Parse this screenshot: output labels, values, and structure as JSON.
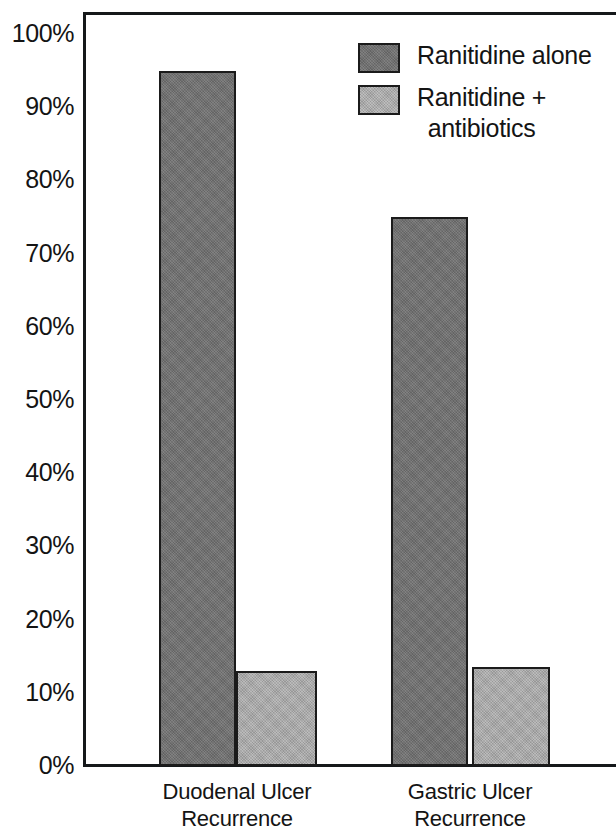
{
  "chart_data": {
    "type": "bar",
    "title": "",
    "xlabel": "",
    "ylabel": "",
    "categories": [
      "Duodenal Ulcer Recurrence",
      "Gastric Ulcer Recurrence"
    ],
    "category_lines": [
      [
        "Duodenal Ulcer",
        "Recurrence"
      ],
      [
        "Gastric Ulcer",
        "Recurrence"
      ]
    ],
    "series": [
      {
        "name": "Ranitidine alone",
        "values": [
          95,
          75
        ],
        "color": "#707070"
      },
      {
        "name": "Ranitidine + antibiotics",
        "values": [
          13,
          13.5
        ],
        "color": "#a9a9a9"
      }
    ],
    "ylim": [
      0,
      100
    ],
    "ytick_labels": [
      "100%",
      "90%",
      "80%",
      "70%",
      "60%",
      "50%",
      "40%",
      "30%",
      "20%",
      "10%",
      "0%"
    ],
    "ytick_values": [
      100,
      90,
      80,
      70,
      60,
      50,
      40,
      30,
      20,
      10,
      0
    ],
    "grid": false,
    "legend_position": "top-right",
    "axis_color": "#15181a",
    "bar_border_color": "#1b1b1b"
  },
  "legend": {
    "entries": [
      {
        "label": "Ranitidine alone",
        "line1": "Ranitidine alone",
        "line2": "",
        "swatch": "dark"
      },
      {
        "label": "Ranitidine + antibiotics",
        "line1": "Ranitidine +",
        "line2": "antibiotics",
        "swatch": "light"
      }
    ]
  },
  "axis": {
    "y_ticks": [
      {
        "label": "100%",
        "value": 100
      },
      {
        "label": "90%",
        "value": 90
      },
      {
        "label": "80%",
        "value": 80
      },
      {
        "label": "70%",
        "value": 70
      },
      {
        "label": "60%",
        "value": 60
      },
      {
        "label": "50%",
        "value": 50
      },
      {
        "label": "40%",
        "value": 40
      },
      {
        "label": "30%",
        "value": 30
      },
      {
        "label": "20%",
        "value": 20
      },
      {
        "label": "10%",
        "value": 10
      },
      {
        "label": "0%",
        "value": 0
      }
    ]
  },
  "x_categories": [
    {
      "line1": "Duodenal Ulcer",
      "line2": "Recurrence"
    },
    {
      "line1": "Gastric Ulcer",
      "line2": "Recurrence"
    }
  ],
  "geometry": {
    "plot_left": 83,
    "plot_top": 12,
    "baseline_y": 766,
    "px_per_percent": 7.32,
    "bars": [
      {
        "left": 159,
        "width": 77,
        "series": 0,
        "category": 0
      },
      {
        "left": 236,
        "width": 81,
        "series": 1,
        "category": 0
      },
      {
        "left": 391,
        "width": 77,
        "series": 0,
        "category": 1
      },
      {
        "left": 472,
        "width": 78,
        "series": 1,
        "category": 1
      }
    ],
    "category_label_centers": [
      237,
      470
    ]
  }
}
